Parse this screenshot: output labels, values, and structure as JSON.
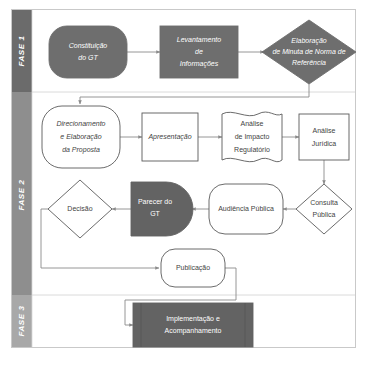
{
  "diagram": {
    "background_color": "#ffffff",
    "outline_color": "#5a5a5a",
    "fill_color": "#6e6e6e",
    "connector_color": "#8a8a8a",
    "phases": [
      {
        "id": "fase-1",
        "label": "FASE 1",
        "band_color": "#6b6b6b"
      },
      {
        "id": "fase-2",
        "label": "FASE 2",
        "band_color": "#8e8e8e"
      },
      {
        "id": "fase-3",
        "label": "FASE 3",
        "band_color": "#a8a8a8"
      }
    ],
    "nodes": [
      {
        "id": "constituicao-do-gt",
        "phase": "fase-1",
        "shape": "terminator",
        "style": "filled",
        "italic": true,
        "lines": [
          "Constituição",
          "do GT"
        ]
      },
      {
        "id": "levantamento-de-informacoes",
        "phase": "fase-1",
        "shape": "rectangle",
        "style": "filled",
        "italic": true,
        "lines": [
          "Levantamento",
          "de",
          "Informações"
        ]
      },
      {
        "id": "elaboracao-de-minuta",
        "phase": "fase-1",
        "shape": "diamond",
        "style": "filled",
        "italic": true,
        "lines": [
          "Elaboração",
          "de Minuta de Norma de",
          "Referência"
        ]
      },
      {
        "id": "direcionamento-e-elaboracao-da-proposta",
        "phase": "fase-2",
        "shape": "terminator",
        "style": "outline",
        "italic": true,
        "lines": [
          "Direcionamento",
          "e Elaboração",
          "da Proposta"
        ]
      },
      {
        "id": "apresentacao",
        "phase": "fase-2",
        "shape": "rectangle",
        "style": "outline",
        "italic": true,
        "lines": [
          "Apresentação"
        ]
      },
      {
        "id": "analise-de-impacto-regulatorio",
        "phase": "fase-2",
        "shape": "document",
        "style": "outline",
        "italic": false,
        "lines": [
          "Análise",
          "de Impacto",
          "Regulatório"
        ]
      },
      {
        "id": "analise-juridica",
        "phase": "fase-2",
        "shape": "rectangle",
        "style": "outline",
        "italic": false,
        "lines": [
          "Análise",
          "Jurídica"
        ]
      },
      {
        "id": "consulta-publica",
        "phase": "fase-2",
        "shape": "diamond",
        "style": "outline",
        "italic": false,
        "lines": [
          "Consulta",
          "Pública"
        ]
      },
      {
        "id": "audiencia-publica",
        "phase": "fase-2",
        "shape": "terminator",
        "style": "outline",
        "italic": false,
        "lines": [
          "Audiência Pública"
        ]
      },
      {
        "id": "parecer-do-gt",
        "phase": "fase-2",
        "shape": "delay",
        "style": "filled",
        "italic": false,
        "lines": [
          "Parecer do",
          "GT"
        ]
      },
      {
        "id": "decisao",
        "phase": "fase-2",
        "shape": "diamond",
        "style": "outline",
        "italic": false,
        "lines": [
          "Decisão"
        ]
      },
      {
        "id": "publicacao",
        "phase": "fase-2",
        "shape": "terminator",
        "style": "outline",
        "italic": false,
        "lines": [
          "Publicação"
        ]
      },
      {
        "id": "implementacao-e-acompanhamento",
        "phase": "fase-3",
        "shape": "predefined-process",
        "style": "filled",
        "italic": false,
        "lines": [
          "Implementação e",
          "Acompanhamento"
        ]
      }
    ],
    "edges": [
      {
        "from": "constituicao-do-gt",
        "to": "levantamento-de-informacoes"
      },
      {
        "from": "levantamento-de-informacoes",
        "to": "elaboracao-de-minuta"
      },
      {
        "from": "elaboracao-de-minuta",
        "to": "direcionamento-e-elaboracao-da-proposta"
      },
      {
        "from": "direcionamento-e-elaboracao-da-proposta",
        "to": "apresentacao"
      },
      {
        "from": "apresentacao",
        "to": "analise-de-impacto-regulatorio"
      },
      {
        "from": "analise-de-impacto-regulatorio",
        "to": "analise-juridica"
      },
      {
        "from": "analise-juridica",
        "to": "consulta-publica"
      },
      {
        "from": "consulta-publica",
        "to": "audiencia-publica"
      },
      {
        "from": "audiencia-publica",
        "to": "parecer-do-gt"
      },
      {
        "from": "parecer-do-gt",
        "to": "decisao"
      },
      {
        "from": "decisao",
        "to": "publicacao"
      },
      {
        "from": "publicacao",
        "to": "implementacao-e-acompanhamento"
      }
    ]
  }
}
